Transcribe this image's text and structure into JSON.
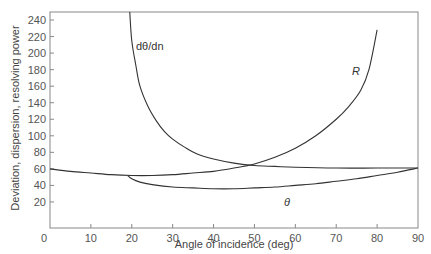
{
  "chart_data": {
    "type": "line",
    "title": "",
    "xlabel": "Angle of incidence (deg)",
    "ylabel": "Deviation, dispersion, resolving power",
    "xlim": [
      0,
      90
    ],
    "ylim": [
      0,
      250
    ],
    "xticks": [
      0,
      10,
      20,
      30,
      40,
      50,
      60,
      70,
      80,
      90
    ],
    "yticks": [
      20,
      40,
      60,
      80,
      100,
      120,
      140,
      160,
      180,
      200,
      220,
      240
    ],
    "grid": false,
    "legend": "inline labels",
    "series": [
      {
        "name": "dθ/dn",
        "label_display": "dθ/dn",
        "x": [
          19.5,
          20,
          21,
          22,
          24,
          26,
          28,
          30,
          33,
          36,
          40,
          45,
          50,
          55,
          60,
          70,
          80,
          90
        ],
        "values": [
          250,
          215,
          185,
          160,
          135,
          118,
          105,
          96,
          86,
          78,
          72,
          67,
          64,
          63,
          62,
          61,
          61,
          61
        ]
      },
      {
        "name": "R",
        "label_display": "R",
        "x": [
          0,
          5,
          10,
          15,
          20,
          25,
          30,
          35,
          40,
          45,
          50,
          55,
          60,
          65,
          70,
          73,
          76,
          78,
          80
        ],
        "values": [
          60,
          57,
          55,
          53,
          52,
          52,
          53,
          55,
          57,
          61,
          66,
          74,
          85,
          100,
          120,
          135,
          155,
          180,
          228
        ]
      },
      {
        "name": "θ",
        "label_display": "θ",
        "x": [
          19,
          20,
          22,
          25,
          30,
          35,
          40,
          45,
          50,
          55,
          60,
          65,
          70,
          75,
          80,
          85,
          90
        ],
        "values": [
          52,
          48,
          44,
          41,
          38,
          37,
          36,
          36,
          37,
          38,
          40,
          42,
          45,
          48,
          52,
          56,
          61
        ]
      }
    ]
  }
}
